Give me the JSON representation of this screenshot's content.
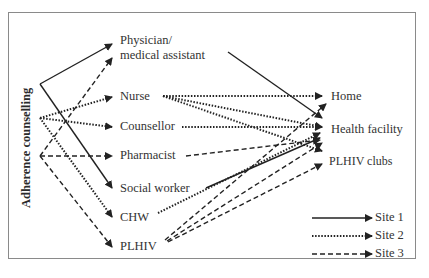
{
  "diagram": {
    "source_label": "Adherence counselling",
    "providers": [
      {
        "id": "physician",
        "line1": "Physician/",
        "line2": "medical assistant"
      },
      {
        "id": "nurse",
        "label": "Nurse"
      },
      {
        "id": "counsellor",
        "label": "Counsellor"
      },
      {
        "id": "pharmacist",
        "label": "Pharmacist"
      },
      {
        "id": "social_worker",
        "label": "Social worker"
      },
      {
        "id": "chw",
        "label": "CHW"
      },
      {
        "id": "plhiv",
        "label": "PLHIV"
      }
    ],
    "locations": [
      {
        "id": "home",
        "label": "Home"
      },
      {
        "id": "health_facility",
        "label": "Health facility"
      },
      {
        "id": "plhiv_clubs",
        "label": "PLHIV clubs"
      }
    ],
    "legend": [
      {
        "style": "solid",
        "label": "Site 1"
      },
      {
        "style": "dotted",
        "label": "Site 2"
      },
      {
        "style": "dashed",
        "label": "Site 3"
      }
    ],
    "edges": {
      "site1_solid": [
        [
          "Adherence counselling",
          "Physician/medical assistant"
        ],
        [
          "Adherence counselling",
          "Social worker"
        ],
        [
          "Physician/medical assistant",
          "Health facility"
        ],
        [
          "Social worker",
          "Health facility"
        ]
      ],
      "site2_dotted": [
        [
          "Adherence counselling",
          "Nurse"
        ],
        [
          "Adherence counselling",
          "Counsellor"
        ],
        [
          "Adherence counselling",
          "CHW"
        ],
        [
          "Nurse",
          "Home"
        ],
        [
          "Nurse",
          "Health facility"
        ],
        [
          "Nurse",
          "PLHIV clubs"
        ],
        [
          "Counsellor",
          "Health facility"
        ],
        [
          "CHW",
          "Health facility"
        ]
      ],
      "site3_dashed": [
        [
          "Adherence counselling",
          "Physician/medical assistant"
        ],
        [
          "Adherence counselling",
          "Pharmacist"
        ],
        [
          "Adherence counselling",
          "PLHIV"
        ],
        [
          "Pharmacist",
          "Health facility"
        ],
        [
          "PLHIV",
          "Home"
        ],
        [
          "PLHIV",
          "Health facility"
        ],
        [
          "PLHIV",
          "PLHIV clubs"
        ]
      ]
    },
    "colors": {
      "line": "#222222",
      "frame": "#8a8a8a",
      "text": "#333333"
    }
  }
}
